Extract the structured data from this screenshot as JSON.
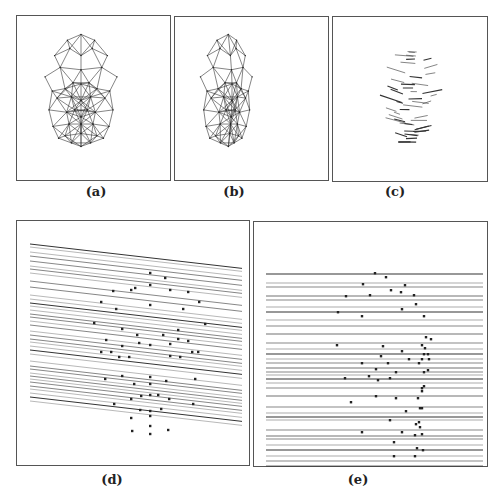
{
  "figure": {
    "panels": [
      {
        "id": "a",
        "label": "(a)",
        "x": 16,
        "y": 15,
        "w": 155,
        "h": 166,
        "content": "Frontal wireframe triangulated face mesh",
        "label_x": 86,
        "label_y": 184
      },
      {
        "id": "b",
        "label": "(b)",
        "x": 174,
        "y": 16,
        "w": 155,
        "h": 165,
        "content": "Rotated (three-quarter view) wireframe face mesh",
        "label_x": 224,
        "label_y": 184
      },
      {
        "id": "c",
        "label": "(c)",
        "x": 332,
        "y": 16,
        "w": 156,
        "h": 166,
        "content": "Short line segments (flow field) over face region",
        "label_x": 385,
        "label_y": 184
      },
      {
        "id": "d",
        "label": "(d)",
        "x": 16,
        "y": 220,
        "w": 234,
        "h": 246,
        "content": "Slanted epipolar lines with feature points",
        "label_x": 102,
        "label_y": 472
      },
      {
        "id": "e",
        "label": "(e)",
        "x": 253,
        "y": 221,
        "w": 235,
        "h": 246,
        "content": "Rectified horizontal epipolar lines with feature points",
        "label_x": 348,
        "label_y": 472
      }
    ]
  },
  "colors": {
    "line": "#333333",
    "light_line": "#888888",
    "dot": "#222222",
    "border": "#555555"
  },
  "chart_data": [
    {
      "type": "table",
      "title": "(d) epipolar lines, slanted",
      "line_slope": 0.115,
      "line_x_range": [
        25,
        241
      ],
      "line_y_at_left": [
        33,
        36,
        41,
        45,
        50,
        55,
        58,
        62,
        70,
        76,
        84,
        88,
        92,
        95,
        99,
        103,
        106,
        110,
        114,
        120,
        124,
        128,
        131,
        135,
        139,
        143,
        150,
        155,
        158,
        162,
        165,
        168,
        171,
        175,
        178,
        182,
        186,
        190
      ],
      "points": [
        [
          133,
          52
        ],
        [
          148,
          57
        ],
        [
          118,
          67
        ],
        [
          96,
          70
        ],
        [
          133,
          64
        ],
        [
          114,
          69
        ],
        [
          153,
          69
        ],
        [
          171,
          71
        ],
        [
          84,
          81
        ],
        [
          133,
          84
        ],
        [
          99,
          88
        ],
        [
          166,
          88
        ],
        [
          182,
          81
        ],
        [
          188,
          103
        ],
        [
          77,
          102
        ],
        [
          161,
          109
        ],
        [
          105,
          108
        ],
        [
          120,
          114
        ],
        [
          146,
          114
        ],
        [
          161,
          118
        ],
        [
          89,
          119
        ],
        [
          105,
          125
        ],
        [
          122,
          122
        ],
        [
          133,
          124
        ],
        [
          153,
          123
        ],
        [
          171,
          120
        ],
        [
          175,
          131
        ],
        [
          84,
          131
        ],
        [
          94,
          131
        ],
        [
          102,
          136
        ],
        [
          112,
          136
        ],
        [
          153,
          135
        ],
        [
          163,
          136
        ],
        [
          181,
          131
        ],
        [
          105,
          155
        ],
        [
          133,
          156
        ],
        [
          149,
          160
        ],
        [
          178,
          158
        ],
        [
          88,
          158
        ],
        [
          117,
          163
        ],
        [
          133,
          163
        ],
        [
          124,
          175
        ],
        [
          133,
          174
        ],
        [
          141,
          174
        ],
        [
          152,
          178
        ],
        [
          176,
          183
        ],
        [
          97,
          183
        ],
        [
          114,
          178
        ],
        [
          123,
          189
        ],
        [
          133,
          190
        ],
        [
          144,
          188
        ],
        [
          114,
          197
        ],
        [
          133,
          195
        ],
        [
          133,
          205
        ],
        [
          151,
          209
        ],
        [
          115,
          210
        ],
        [
          133,
          213
        ]
      ]
    },
    {
      "type": "table",
      "title": "(e) epipolar lines, rectified horizontal",
      "line_x_range": [
        12,
        229
      ],
      "line_y": [
        32,
        41,
        45,
        54,
        58,
        65,
        70,
        78,
        84,
        92,
        101,
        107,
        112,
        117,
        121,
        126,
        130,
        133,
        137,
        141,
        146,
        154,
        165,
        171,
        175,
        178,
        188,
        194,
        197,
        203,
        208,
        214,
        219,
        224,
        229,
        234
      ],
      "points": [
        [
          121,
          31
        ],
        [
          132,
          35
        ],
        [
          109,
          42
        ],
        [
          151,
          43
        ],
        [
          137,
          48
        ],
        [
          147,
          50
        ],
        [
          92,
          54
        ],
        [
          116,
          53
        ],
        [
          160,
          53
        ],
        [
          162,
          62
        ],
        [
          148,
          67
        ],
        [
          84,
          70
        ],
        [
          108,
          74
        ],
        [
          170,
          74
        ],
        [
          172,
          95
        ],
        [
          177,
          97
        ],
        [
          83,
          103
        ],
        [
          129,
          104
        ],
        [
          148,
          109
        ],
        [
          168,
          103
        ],
        [
          171,
          106
        ],
        [
          170,
          112
        ],
        [
          174,
          112
        ],
        [
          127,
          114
        ],
        [
          155,
          117
        ],
        [
          168,
          117
        ],
        [
          175,
          117
        ],
        [
          108,
          121
        ],
        [
          134,
          121
        ],
        [
          165,
          121
        ],
        [
          122,
          127
        ],
        [
          142,
          130
        ],
        [
          170,
          130
        ],
        [
          174,
          128
        ],
        [
          91,
          136
        ],
        [
          115,
          134
        ],
        [
          124,
          138
        ],
        [
          136,
          136
        ],
        [
          170,
          144
        ],
        [
          168,
          146
        ],
        [
          168,
          149
        ],
        [
          122,
          154
        ],
        [
          142,
          156
        ],
        [
          164,
          156
        ],
        [
          97,
          160
        ],
        [
          166,
          166
        ],
        [
          168,
          166
        ],
        [
          152,
          169
        ],
        [
          136,
          178
        ],
        [
          165,
          180
        ],
        [
          162,
          182
        ],
        [
          166,
          185
        ],
        [
          108,
          190
        ],
        [
          148,
          190
        ],
        [
          161,
          193
        ],
        [
          168,
          192
        ],
        [
          140,
          200
        ],
        [
          163,
          206
        ],
        [
          169,
          208
        ],
        [
          140,
          214
        ],
        [
          161,
          214
        ]
      ]
    }
  ]
}
